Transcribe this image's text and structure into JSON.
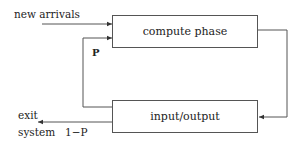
{
  "diagram": {
    "nodes": {
      "compute": {
        "label": "compute phase"
      },
      "io": {
        "label": "input/output"
      }
    },
    "labels": {
      "new_arrivals": "new arrivals",
      "feedback_prob": "P",
      "exit_line1": "exit",
      "exit_line2": "system",
      "exit_prob": "1−P"
    },
    "edges": [
      {
        "from": "external",
        "to": "compute",
        "label": "new arrivals"
      },
      {
        "from": "compute",
        "to": "io",
        "label": ""
      },
      {
        "from": "io",
        "to": "compute",
        "label": "P"
      },
      {
        "from": "io",
        "to": "exit system",
        "label": "1−P"
      }
    ],
    "colors": {
      "line": "#555555",
      "text": "#222222"
    }
  }
}
